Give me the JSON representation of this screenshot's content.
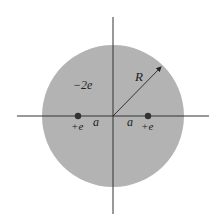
{
  "diagram": {
    "title": "",
    "colors": {
      "disk_fill": "#b3b3b3",
      "axis_stroke": "#333333",
      "charge_dot": "#333333",
      "background": "#ffffff"
    },
    "disk": {
      "charge_label": "−2e",
      "radius_label": "R"
    },
    "charges": [
      {
        "label": "+e",
        "side": "left"
      },
      {
        "label": "+e",
        "side": "right"
      }
    ],
    "distances": [
      {
        "label": "a",
        "side": "left"
      },
      {
        "label": "a",
        "side": "right"
      }
    ]
  }
}
